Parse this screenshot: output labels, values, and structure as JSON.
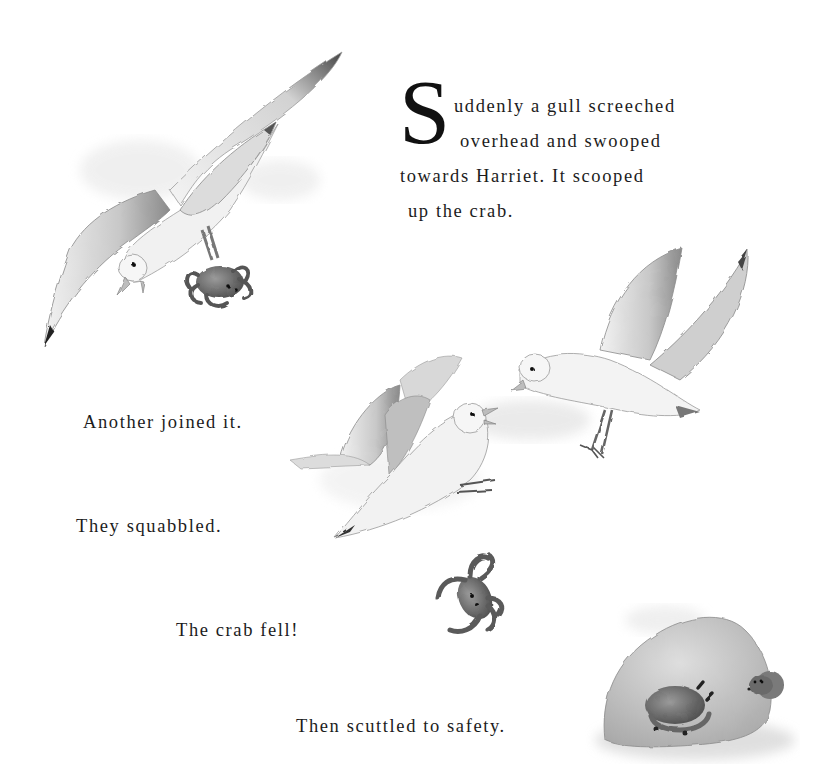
{
  "page": {
    "type": "picture-book-spread",
    "background": "#ffffff"
  },
  "story": {
    "opening": {
      "drop_cap": "S",
      "line1": "uddenly a gull screeched",
      "line2": "overhead and swooped",
      "line3": "towards Harriet. It scooped",
      "line4": "up the crab."
    },
    "line_another": "Another joined it.",
    "line_squabbled": "They squabbled.",
    "line_fell": "The crab fell!",
    "line_safety": "Then scuttled to safety."
  },
  "illustrations": [
    {
      "name": "gull-carrying-crab",
      "description": "Gull swooping down holding a crab in its feet"
    },
    {
      "name": "two-gulls-squabbling",
      "description": "Two gulls flapping and squabbling mid-air"
    },
    {
      "name": "falling-crab",
      "description": "Crab tumbling through the air"
    },
    {
      "name": "crab-hiding-by-rock",
      "description": "Crab scuttling beside a large rock with a mouse peeking out"
    }
  ],
  "colors": {
    "text": "#1c1c1c",
    "ink": "#2a2a2a",
    "wash": "#b8b8b8"
  }
}
